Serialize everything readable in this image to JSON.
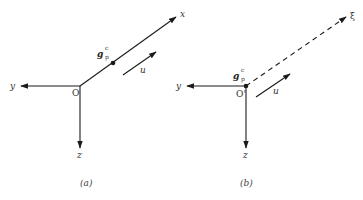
{
  "panels": [
    {
      "id": "a",
      "caption": "(a)",
      "origin_label": "O",
      "axes": {
        "x": "x",
        "y": "y",
        "z": "z"
      },
      "point_label": {
        "base": "g",
        "sub": "p",
        "sup": "c"
      },
      "velocity_label": "u",
      "x_axis_style": "solid"
    },
    {
      "id": "b",
      "caption": "(b)",
      "origin_label": "O'",
      "axes": {
        "xi": "ξ",
        "y": "y",
        "z": "z"
      },
      "point_label": {
        "base": "g",
        "sub": "p",
        "sup": "c"
      },
      "velocity_label": "u",
      "xi_axis_style": "dashed"
    }
  ],
  "colors": {
    "ink": "#1a1a1a",
    "background": "#ffffff"
  }
}
